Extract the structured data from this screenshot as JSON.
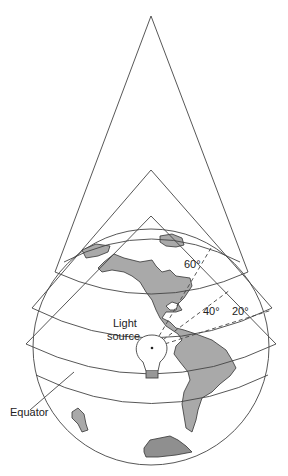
{
  "figure": {
    "type": "diagram",
    "labels": {
      "light_source_line1": "Light",
      "light_source_line2": "source",
      "equator": "Equator",
      "angle_60": "60°",
      "angle_40": "40°",
      "angle_20": "20°"
    },
    "cones": [
      {
        "name": "cone-60",
        "latitude": "60°"
      },
      {
        "name": "cone-40",
        "latitude": "40°"
      },
      {
        "name": "cone-20",
        "latitude": "20°"
      }
    ],
    "colors": {
      "line": "#444444",
      "land": "#a9a9a9",
      "land_dark": "#8f8f8f",
      "background": "#ffffff"
    }
  }
}
